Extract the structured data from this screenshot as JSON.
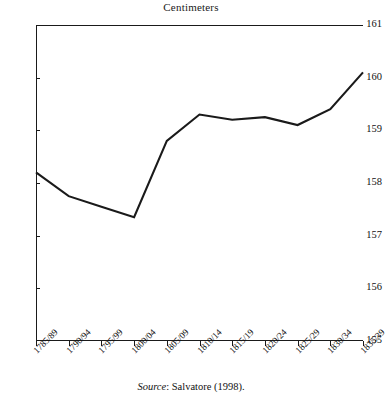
{
  "chart_data": {
    "type": "line",
    "title": "Centimeters",
    "xlabel": "",
    "ylabel": "Centimeters",
    "ylim": [
      155,
      161
    ],
    "yticks": [
      155,
      156,
      157,
      158,
      159,
      160,
      161
    ],
    "grid": false,
    "legend": null,
    "line_color": "#1a1a1a",
    "categories": [
      "1785/89",
      "1790/94",
      "1795/99",
      "1800/04",
      "1805/09",
      "1810/14",
      "1815/19",
      "1820/24",
      "1825/29",
      "1830/34",
      "1835/39"
    ],
    "values": [
      158.2,
      157.75,
      157.55,
      157.35,
      158.8,
      159.3,
      159.2,
      159.25,
      159.1,
      159.4,
      160.1
    ],
    "series": [
      {
        "name": "Height",
        "values": [
          158.2,
          157.75,
          157.55,
          157.35,
          158.8,
          159.3,
          159.2,
          159.25,
          159.1,
          159.4,
          160.1
        ]
      }
    ],
    "annotations": []
  },
  "caption": {
    "source_word": "Source",
    "source_text": ": Salvatore (1998)."
  }
}
